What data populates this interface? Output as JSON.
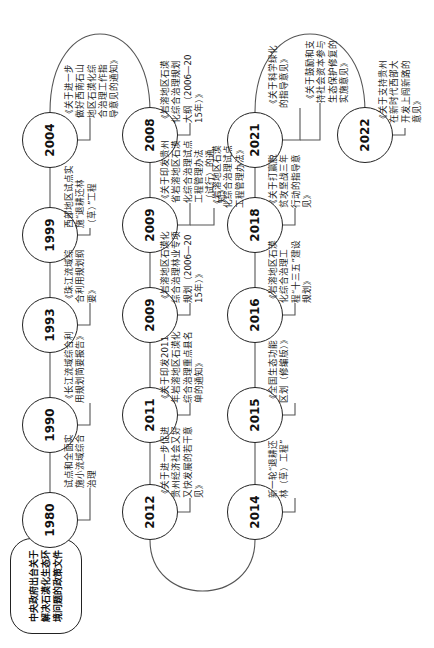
{
  "title": "中央政府出台关于解决石漠化生态环境问题的政策文件",
  "timeline": [
    {
      "year": "1980",
      "docs": [
        "试点和全面实施小流域综合治理"
      ]
    },
    {
      "year": "1990",
      "docs": [
        "《长江流域综合利用规划简要报告》"
      ]
    },
    {
      "year": "1993",
      "docs": [
        "《珠江流域综合利用规划纲要》"
      ]
    },
    {
      "year": "1999",
      "docs": [
        "西部地区试点实施“退耕还林（草）”工程"
      ]
    },
    {
      "year": "2004",
      "docs": [
        "《关于进一步做好西南石山地区石漠化综合治理工作指导意见的通知》"
      ]
    },
    {
      "year": "2008",
      "docs": [
        "《岩溶地区石漠化综合治理规划大纲（2006—2015年）》"
      ]
    },
    {
      "year": "2009",
      "docs": [
        "《关于印发贵州省岩溶地区石漠化综合治理试点工程管理办法（试行）的通知》",
        "《岩溶地区石漠化综合治理试点工程管理办法》"
      ]
    },
    {
      "year": "2009",
      "docs": [
        "《岩溶地区石漠化综合治理林业专项规划（2006—2015年）》"
      ]
    },
    {
      "year": "2011",
      "docs": [
        "《关于印发2011年岩溶地区石漠化综合治理重点县名单的通知》"
      ]
    },
    {
      "year": "2012",
      "docs": [
        "《关于进一步促进贵州经济社会又好又快发展的若干意见》"
      ]
    },
    {
      "year": "2014",
      "docs": [
        "新一轮“退耕还林（草）工程”"
      ]
    },
    {
      "year": "2015",
      "docs": [
        "《全国生态功能区划（修编版）》"
      ]
    },
    {
      "year": "2016",
      "docs": [
        "《岩溶地区石漠化综合治理工程“十三五”建设规划》"
      ]
    },
    {
      "year": "2018",
      "docs": [
        "《关于打赢脱贫攻坚战三年行动的指导意见》"
      ]
    },
    {
      "year": "2021",
      "docs": [
        "《关于科学绿化的指导意见》",
        "《关于鼓励和支持社会资本参与生态保护修复的实施意见》"
      ]
    },
    {
      "year": "2022",
      "docs": [
        "《关于支持贵州在新时代西部大开发上闯新路的意见》"
      ]
    }
  ],
  "colors": {
    "line": "#222222",
    "connector": "#888888",
    "text": "#222222",
    "background": "#ffffff"
  }
}
